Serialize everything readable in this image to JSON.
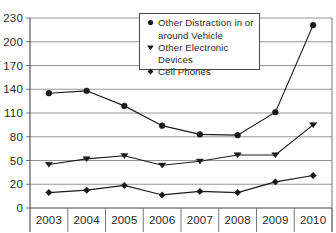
{
  "chart_data": {
    "type": "line",
    "title": "",
    "xlabel": "",
    "ylabel": "",
    "categories": [
      "2003",
      "2004",
      "2005",
      "2006",
      "2007",
      "2008",
      "2009",
      "2010"
    ],
    "yticks": [
      0,
      20,
      50,
      80,
      110,
      140,
      170,
      200,
      230
    ],
    "ylim": [
      0,
      230
    ],
    "grid": true,
    "legend_position": "top-center",
    "series": [
      {
        "name": "Other Distraction in or around Vehicle",
        "name_line1": "Other Distraction in or",
        "name_line2": "around Vehicle",
        "marker": "circle",
        "color": "#1a1a1a",
        "values": [
          135,
          138,
          119,
          94,
          83,
          82,
          111,
          221
        ]
      },
      {
        "name": "Other Electronic Devices",
        "name_line1": "Other Electronic Devices",
        "name_line2": "",
        "marker": "triangle-down",
        "color": "#1a1a1a",
        "values": [
          45,
          52,
          56,
          44,
          49,
          57,
          57,
          95
        ]
      },
      {
        "name": "Cell Phones",
        "name_line1": "Cell Phones",
        "name_line2": "",
        "marker": "diamond",
        "color": "#1a1a1a",
        "values": [
          13,
          15,
          19,
          11,
          14,
          13,
          23,
          31
        ]
      }
    ]
  }
}
